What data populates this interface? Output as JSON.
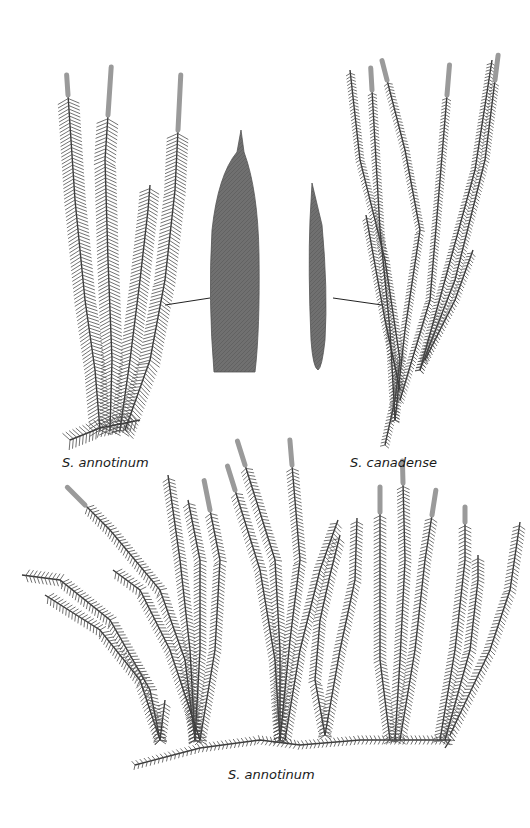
{
  "figure": {
    "labels": {
      "top_left": "S. annotinum",
      "top_right": "S. canadense",
      "bottom": "S. annotinum"
    },
    "panels": [
      {
        "id": "top-left-specimen",
        "species": "S. annotinum",
        "description": "upright shoots with dense spreading leaves and terminal strobili"
      },
      {
        "id": "leaf-annotinum",
        "species": "S. annotinum",
        "description": "enlarged leaf, broad, toothed margin, acuminate tip"
      },
      {
        "id": "leaf-canadense",
        "species": "S. canadense",
        "description": "enlarged leaf, narrow, entire margin"
      },
      {
        "id": "top-right-specimen",
        "species": "S. canadense",
        "description": "slender branching shoots with sparse leaves and small strobili"
      },
      {
        "id": "bottom-specimen",
        "species": "S. annotinum",
        "description": "creeping horizontal stem with many upright leafy shoots"
      }
    ],
    "colors": {
      "ink": "#3a3a3a",
      "leaf_fill": "#6e6e6e",
      "strobilus": "#9a9a9a",
      "background": "#ffffff"
    }
  }
}
